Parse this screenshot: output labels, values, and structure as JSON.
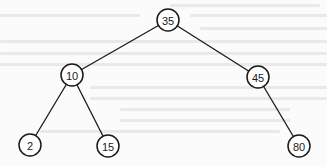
{
  "diagram": {
    "type": "binary-search-tree",
    "root": "35",
    "nodes": [
      {
        "id": "n35",
        "label": "35",
        "x": 168,
        "y": 20
      },
      {
        "id": "n10",
        "label": "10",
        "x": 72,
        "y": 75
      },
      {
        "id": "n45",
        "label": "45",
        "x": 258,
        "y": 77
      },
      {
        "id": "n2",
        "label": "2",
        "x": 30,
        "y": 145
      },
      {
        "id": "n15",
        "label": "15",
        "x": 108,
        "y": 146
      },
      {
        "id": "n80",
        "label": "80",
        "x": 299,
        "y": 146
      }
    ],
    "edges": [
      {
        "from": "35",
        "to": "10",
        "side": "left"
      },
      {
        "from": "35",
        "to": "45",
        "side": "right"
      },
      {
        "from": "10",
        "to": "2",
        "side": "left"
      },
      {
        "from": "10",
        "to": "15",
        "side": "right"
      },
      {
        "from": "45",
        "to": "80",
        "side": "right"
      }
    ],
    "node_radius": 11,
    "colors": {
      "stroke": "#1a1a1a",
      "fill": "#ffffff",
      "background": "#fbfbfb"
    }
  }
}
